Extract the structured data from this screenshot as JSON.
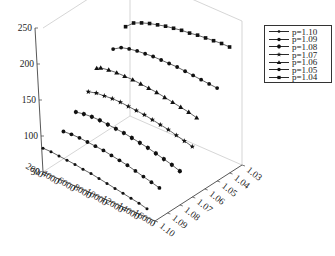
{
  "chart_data": {
    "type": "line",
    "subtype": "3d-line",
    "title": "",
    "xlabel": "",
    "ylabel": "",
    "zlabel": "",
    "x_ticks": [
      "2000",
      "4000",
      "6000",
      "8000",
      "10000",
      "12000",
      "14000",
      "16000"
    ],
    "y_ticks": [
      "1.03",
      "1.04",
      "1.05",
      "1.06",
      "1.07",
      "1.08",
      "1.09",
      "1.10"
    ],
    "z_ticks": [
      "50",
      "100",
      "150",
      "200",
      "250"
    ],
    "xlim": [
      2000,
      16000
    ],
    "ylim": [
      1.03,
      1.1
    ],
    "zlim": [
      50,
      250
    ],
    "grid": false,
    "legend_position": "upper right, outside",
    "series": [
      {
        "name": "p=1.10",
        "p": 1.1,
        "marker": "dot-small",
        "x": [
          2000,
          3000,
          4000,
          5000,
          6000,
          7000,
          8000,
          9000,
          10000,
          11000,
          12000,
          13000,
          14000,
          15000
        ],
        "z": [
          83,
          83,
          82,
          81,
          80,
          78,
          77,
          75,
          73,
          71,
          69,
          67,
          65,
          62
        ]
      },
      {
        "name": "p=1.09",
        "p": 1.09,
        "marker": "dot",
        "x": [
          3000,
          4000,
          5000,
          6000,
          7000,
          8000,
          9000,
          10000,
          11000,
          12000,
          13000,
          14000,
          15000
        ],
        "z": [
          100,
          101,
          101,
          100,
          99,
          98,
          96,
          94,
          92,
          89,
          86,
          83,
          80
        ]
      },
      {
        "name": "p=1.08",
        "p": 1.08,
        "marker": "diamond-dot",
        "x": [
          3000,
          4000,
          5000,
          6000,
          7000,
          8000,
          9000,
          10000,
          11000,
          12000,
          13000,
          14000,
          15000,
          16000
        ],
        "z": [
          116,
          118,
          119,
          119,
          118,
          117,
          116,
          114,
          112,
          110,
          107,
          104,
          101,
          97
        ]
      },
      {
        "name": "p=1.07",
        "p": 1.07,
        "marker": "star",
        "x": [
          3000,
          4000,
          5000,
          6000,
          7000,
          8000,
          9000,
          10000,
          11000,
          12000,
          13000,
          14000,
          15000,
          16000
        ],
        "z": [
          133,
          136,
          137,
          138,
          138,
          137,
          136,
          135,
          133,
          131,
          129,
          126,
          123,
          120
        ]
      },
      {
        "name": "p=1.06",
        "p": 1.06,
        "marker": "triangle",
        "x": [
          2500,
          3000,
          4000,
          5000,
          6000,
          7000,
          8000,
          9000,
          10000,
          11000,
          12000,
          13000,
          14000,
          15000
        ],
        "z": [
          152,
          155,
          157,
          158,
          158,
          158,
          157,
          156,
          155,
          153,
          151,
          149,
          147,
          144
        ]
      },
      {
        "name": "p=1.05",
        "p": 1.05,
        "marker": "dot",
        "x": [
          3000,
          4000,
          5000,
          6000,
          7000,
          8000,
          9000,
          10000,
          11000,
          12000,
          13000,
          14000,
          15000,
          16000
        ],
        "z": [
          170,
          177,
          180,
          182,
          183,
          184,
          184,
          184,
          184,
          183,
          182,
          181,
          180,
          179
        ]
      },
      {
        "name": "p=1.04",
        "p": 1.04,
        "marker": "square",
        "x": [
          3000,
          4000,
          5000,
          6000,
          7000,
          8000,
          9000,
          10000,
          11000,
          12000,
          13000,
          14000,
          15000,
          16000
        ],
        "z": [
          190,
          200,
          205,
          209,
          212,
          215,
          217,
          219,
          220,
          222,
          223,
          224,
          225,
          225
        ]
      }
    ]
  },
  "legend": {
    "items": [
      {
        "label": "p=1.10",
        "marker": "dot-small"
      },
      {
        "label": "p=1.09",
        "marker": "dot"
      },
      {
        "label": "p=1.08",
        "marker": "diamond-dot"
      },
      {
        "label": "p=1.07",
        "marker": "star"
      },
      {
        "label": "p=1.06",
        "marker": "triangle"
      },
      {
        "label": "p=1.05",
        "marker": "dot"
      },
      {
        "label": "p=1.04",
        "marker": "square"
      }
    ]
  },
  "colors": {
    "line": "#222222",
    "axis": "#444444",
    "box": "#bbbbbb"
  }
}
